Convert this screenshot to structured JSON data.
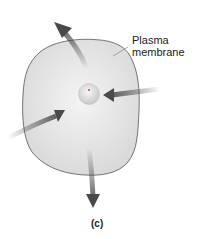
{
  "figure": {
    "labels": {
      "plasma_membrane_line1": "Plasma",
      "plasma_membrane_line2": "membrane"
    },
    "caption": "(c)",
    "colors": {
      "cell_fill": "#e6e6e6",
      "cell_outline": "#555555",
      "arrow": "#4a4a4a",
      "text": "#222222"
    }
  }
}
